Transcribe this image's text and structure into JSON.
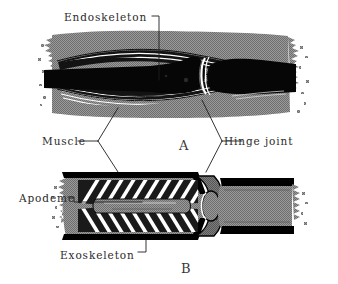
{
  "figure": {
    "background_color": "#ffffff",
    "ink_color": "#000000",
    "tissue_gray": "#8d8d8d",
    "label_color": "#2b2b2b"
  },
  "labels": {
    "endoskeleton": "Endoskeleton",
    "muscle": "Muscle",
    "hinge_joint": "Hinge joint",
    "apodeme": "Apodeme",
    "exoskeleton": "Exoskeleton"
  },
  "panels": {
    "a": {
      "letter": "A",
      "caption": "Endoskeleton limb — internal bone with muscles outside",
      "parts": [
        "endoskeleton",
        "muscle",
        "hinge joint"
      ]
    },
    "b": {
      "letter": "B",
      "caption": "Exoskeleton limb — external cuticle with muscles inside",
      "parts": [
        "exoskeleton",
        "muscle",
        "apodeme",
        "hinge joint"
      ]
    }
  },
  "leaders": [
    {
      "name": "endoskeleton-leader",
      "from": "Endoskeleton",
      "to": "panel A bone"
    },
    {
      "name": "muscle-leader",
      "from": "Muscle",
      "to": "panel A muscle and panel B muscle"
    },
    {
      "name": "hinge-joint-leader",
      "from": "Hinge joint",
      "to": "panel A joint and panel B joint"
    },
    {
      "name": "apodeme-leader",
      "from": "Apodeme",
      "to": "panel B apodeme rod"
    },
    {
      "name": "exoskeleton-leader",
      "from": "Exoskeleton",
      "to": "panel B cuticle wall"
    }
  ]
}
